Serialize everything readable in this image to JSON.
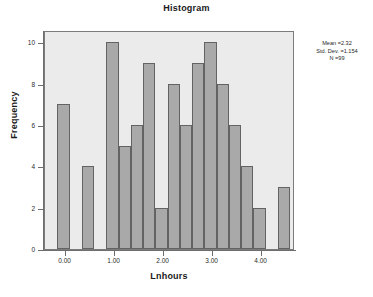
{
  "chart_data": {
    "type": "bar",
    "title": "Histogram",
    "xlabel": "Lnhours",
    "ylabel": "Frequency",
    "grid": false,
    "legend_position": "none",
    "xlim": [
      -0.42,
      4.68
    ],
    "ylim": [
      0,
      10.6
    ],
    "bin_width": 0.25,
    "x_ticks": [
      "0.00",
      "1.00",
      "2.00",
      "3.00",
      "4.00"
    ],
    "x_tick_values": [
      0.0,
      1.0,
      2.0,
      3.0,
      4.0
    ],
    "y_ticks": [
      "0",
      "2",
      "4",
      "6",
      "8",
      "10"
    ],
    "y_tick_values": [
      0,
      2,
      4,
      6,
      8,
      10
    ],
    "bin_starts": [
      -0.17,
      0.08,
      0.33,
      0.58,
      0.83,
      1.08,
      1.33,
      1.58,
      1.83,
      2.08,
      2.33,
      2.58,
      2.83,
      3.08,
      3.33,
      3.58,
      3.83,
      4.08,
      4.33
    ],
    "categories": [
      "-0.17",
      "0.08",
      "0.33",
      "0.58",
      "0.83",
      "1.08",
      "1.33",
      "1.58",
      "1.83",
      "2.08",
      "2.33",
      "2.58",
      "2.83",
      "3.08",
      "3.33",
      "3.58",
      "3.83",
      "4.08",
      "4.33"
    ],
    "values": [
      7,
      0,
      4,
      0,
      10,
      5,
      6,
      9,
      2,
      8,
      6,
      9,
      10,
      8,
      6,
      4,
      2,
      0,
      3
    ],
    "annotations": {
      "mean_label": "Mean =2.32",
      "std_dev_label": "Std. Dev. =1.154",
      "n_label": "N =99"
    },
    "colors": {
      "bar_fill": "#a9a9a9",
      "bar_border": "#636363",
      "plot_background": "#ebebeb",
      "frame_border": "#7b7b7b",
      "axis": "#6d6d6d",
      "text": "#1a1a1a"
    }
  }
}
